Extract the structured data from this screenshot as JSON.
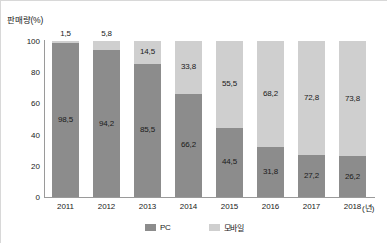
{
  "chart_data": {
    "type": "bar",
    "subtype": "stacked-100-percent",
    "title": "",
    "ylabel": "판매량(%)",
    "xlabel": "(년)",
    "ylim": [
      0,
      100
    ],
    "yticks": [
      "100",
      "80",
      "60",
      "40",
      "20",
      "0"
    ],
    "grid": false,
    "legend_position": "bottom-center",
    "categories": [
      "2011",
      "2012",
      "2013",
      "2014",
      "2015",
      "2016",
      "2017",
      "2018"
    ],
    "series": [
      {
        "name": "PC",
        "color": "#8c8c8c",
        "values": [
          98.5,
          94.2,
          85.5,
          66.2,
          44.5,
          31.8,
          27.2,
          26.2
        ],
        "labels": [
          "98,5",
          "94,2",
          "85,5",
          "66,2",
          "44,5",
          "31,8",
          "27,2",
          "26,2"
        ]
      },
      {
        "name": "모바일",
        "color": "#cfcfcf",
        "values": [
          1.5,
          5.8,
          14.5,
          33.8,
          55.5,
          68.2,
          72.8,
          73.8
        ],
        "labels": [
          "1,5",
          "5,8",
          "14,5",
          "33,8",
          "55,5",
          "68,2",
          "72,8",
          "73,8"
        ]
      }
    ]
  },
  "legend": {
    "items": [
      {
        "label": "PC",
        "color": "#8c8c8c"
      },
      {
        "label": "모바일",
        "color": "#cfcfcf"
      }
    ]
  }
}
